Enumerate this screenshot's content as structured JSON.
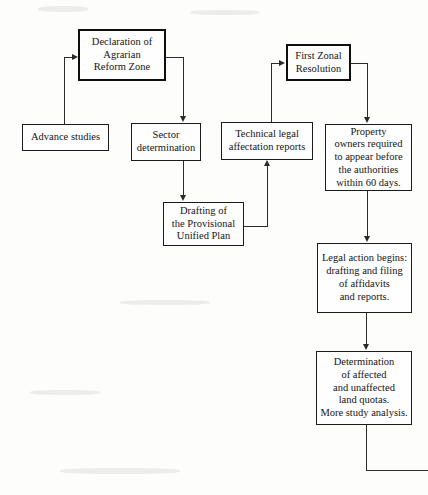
{
  "diagram": {
    "page_background": "#fdfdfc",
    "line_color": "#2a2a2a",
    "text_color": "#141414",
    "nodes": [
      {
        "id": "declaration",
        "label": "Declaration of\nAgrarian\nReform Zone",
        "emphasis": true,
        "x": 78,
        "y": 29,
        "w": 88,
        "h": 52
      },
      {
        "id": "advance-studies",
        "label": "Advance studies",
        "emphasis": false,
        "x": 22,
        "y": 124,
        "w": 87,
        "h": 27
      },
      {
        "id": "sector-determination",
        "label": "Sector\ndetermination",
        "emphasis": false,
        "x": 131,
        "y": 123,
        "w": 70,
        "h": 38
      },
      {
        "id": "technical-legal-reports",
        "label": "Technical legal\naffectation reports",
        "emphasis": false,
        "x": 221,
        "y": 122,
        "w": 92,
        "h": 38
      },
      {
        "id": "first-zonal-resolution",
        "label": "First Zonal\nResolution",
        "emphasis": true,
        "x": 286,
        "y": 44,
        "w": 65,
        "h": 37
      },
      {
        "id": "property-owners",
        "label": "Property\nowners required\nto appear before\nthe authorities\nwithin 60 days.",
        "emphasis": false,
        "x": 325,
        "y": 124,
        "w": 87,
        "h": 67
      },
      {
        "id": "drafting-plan",
        "label": "Drafting of\nthe Provisional\nUnified Plan",
        "emphasis": false,
        "x": 163,
        "y": 202,
        "w": 81,
        "h": 44
      },
      {
        "id": "legal-action",
        "label": "Legal action begins:\ndrafting and filing\nof affidavits\nand reports.",
        "emphasis": false,
        "x": 317,
        "y": 243,
        "w": 95,
        "h": 70
      },
      {
        "id": "determination-quotas",
        "label": "Determination\nof affected\nand unaffected\nland quotas.\nMore study analysis.",
        "emphasis": false,
        "x": 316,
        "y": 351,
        "w": 96,
        "h": 74
      }
    ],
    "edges": [
      {
        "id": "advance-to-declaration",
        "from": "advance-studies",
        "to": "declaration",
        "arrowhead": "right"
      },
      {
        "id": "declaration-to-sector",
        "from": "declaration",
        "to": "sector-determination",
        "arrowhead": "down"
      },
      {
        "id": "sector-to-drafting",
        "from": "sector-determination",
        "to": "drafting-plan",
        "arrowhead": "down"
      },
      {
        "id": "drafting-to-technical",
        "from": "drafting-plan",
        "to": "technical-legal-reports",
        "arrowhead": "up"
      },
      {
        "id": "technical-to-zonal",
        "from": "technical-legal-reports",
        "to": "first-zonal-resolution",
        "arrowhead": "right"
      },
      {
        "id": "zonal-to-owners",
        "from": "first-zonal-resolution",
        "to": "property-owners",
        "arrowhead": "down"
      },
      {
        "id": "owners-to-legal-action",
        "from": "property-owners",
        "to": "legal-action",
        "arrowhead": "down"
      },
      {
        "id": "legal-action-to-determination",
        "from": "legal-action",
        "to": "determination-quotas",
        "arrowhead": "down"
      },
      {
        "id": "determination-to-continuation",
        "from": "determination-quotas",
        "to": "offpage-continuation",
        "arrowhead": "none"
      }
    ]
  }
}
